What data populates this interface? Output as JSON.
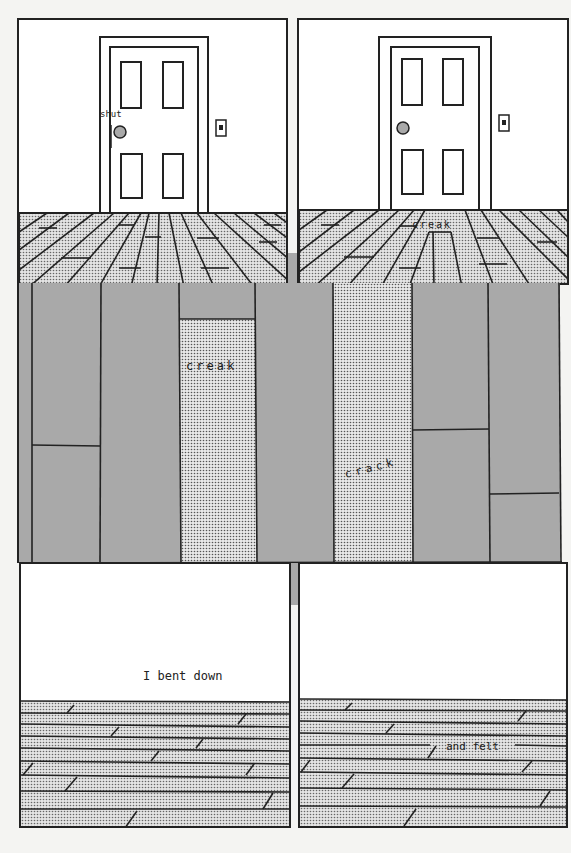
{
  "page": {
    "background": "#f4f4f2",
    "ink": "#222222",
    "gray": "#a9a9a9",
    "dot_fill": "#d8d8d8"
  },
  "panels": [
    {
      "id": "panel-1",
      "caption": "shut",
      "scene": "closed door, knob, light switch, perspective floorboards"
    },
    {
      "id": "panel-2",
      "caption": "creak",
      "scene": "closed door, knob, light switch, perspective floorboards"
    },
    {
      "id": "panel-middle",
      "captions": [
        "creak",
        "crack"
      ],
      "scene": "close-up of vertical floorboards"
    },
    {
      "id": "panel-3",
      "caption": "I bent down",
      "scene": "horizontal floorboards"
    },
    {
      "id": "panel-4",
      "caption": "and felt",
      "scene": "horizontal floorboards"
    }
  ],
  "icons": {
    "door_knob": "door-knob-icon",
    "light_switch": "light-switch-icon"
  }
}
